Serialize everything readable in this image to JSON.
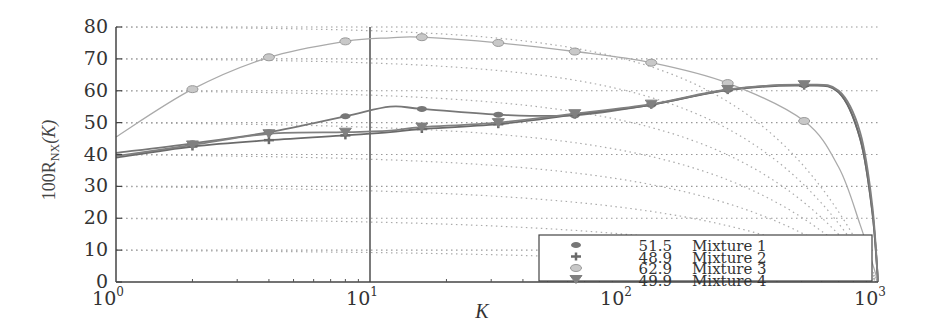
{
  "chart_data": {
    "type": "line",
    "title": "",
    "xlabel": "K",
    "ylabel": "100R_NX(K)",
    "xscale": "log",
    "xlim": [
      1,
      1000
    ],
    "ylim": [
      0,
      80
    ],
    "xticks": [
      {
        "value": 1,
        "base": "10",
        "exp": "0"
      },
      {
        "value": 10,
        "base": "10",
        "exp": "1"
      },
      {
        "value": 100,
        "base": "10",
        "exp": "2"
      },
      {
        "value": 1000,
        "base": "10",
        "exp": "3"
      }
    ],
    "yticks": [
      0,
      10,
      20,
      30,
      40,
      50,
      60,
      70,
      80
    ],
    "grid": "horizontal dotted",
    "reference_line_x": 10,
    "reference_curves": "dotted iso-curves starting at each gridline level and falling to 0 at K=1000",
    "legend_position": "lower right",
    "x": [
      1,
      2,
      4,
      8,
      12,
      16,
      32,
      64,
      128,
      256,
      512,
      700,
      850,
      950,
      1000
    ],
    "series": [
      {
        "name": "Mixture 1",
        "score": "51.5",
        "marker": "asterisk",
        "color": "#777777",
        "values": [
          40.5,
          43.5,
          47.0,
          52.0,
          55.0,
          54.3,
          52.5,
          52.3,
          55.6,
          60.3,
          61.8,
          59.5,
          45.0,
          22.0,
          0
        ]
      },
      {
        "name": "Mixture 2",
        "score": "48.9",
        "marker": "plus",
        "color": "#6a6a6a",
        "values": [
          39.0,
          42.5,
          44.5,
          46.0,
          47.0,
          48.0,
          49.5,
          52.5,
          55.6,
          60.2,
          61.6,
          59.5,
          45.0,
          22.0,
          0
        ]
      },
      {
        "name": "Mixture 3",
        "score": "62.9",
        "marker": "circle",
        "color": "#aaaaaa",
        "values": [
          45.5,
          60.5,
          70.5,
          75.5,
          76.6,
          76.8,
          75.0,
          72.3,
          68.8,
          62.4,
          50.5,
          36.0,
          18.0,
          6.0,
          0
        ]
      },
      {
        "name": "Mixture 4",
        "score": "49.9",
        "marker": "triangle-down",
        "color": "#808080",
        "values": [
          39.5,
          43.0,
          46.5,
          47.0,
          47.5,
          48.6,
          50.0,
          52.8,
          55.8,
          60.4,
          61.9,
          60.0,
          47.0,
          24.0,
          0
        ]
      }
    ]
  },
  "legend": {
    "items": [
      {
        "score": "51.5",
        "label": "Mixture 1"
      },
      {
        "score": "48.9",
        "label": "Mixture 2"
      },
      {
        "score": "62.9",
        "label": "Mixture 3"
      },
      {
        "score": "49.9",
        "label": "Mixture 4"
      }
    ]
  },
  "axes": {
    "xlabel": "K",
    "ylabel_prefix": "100R",
    "ylabel_sub": "NX",
    "ylabel_suffix": "(K)"
  }
}
